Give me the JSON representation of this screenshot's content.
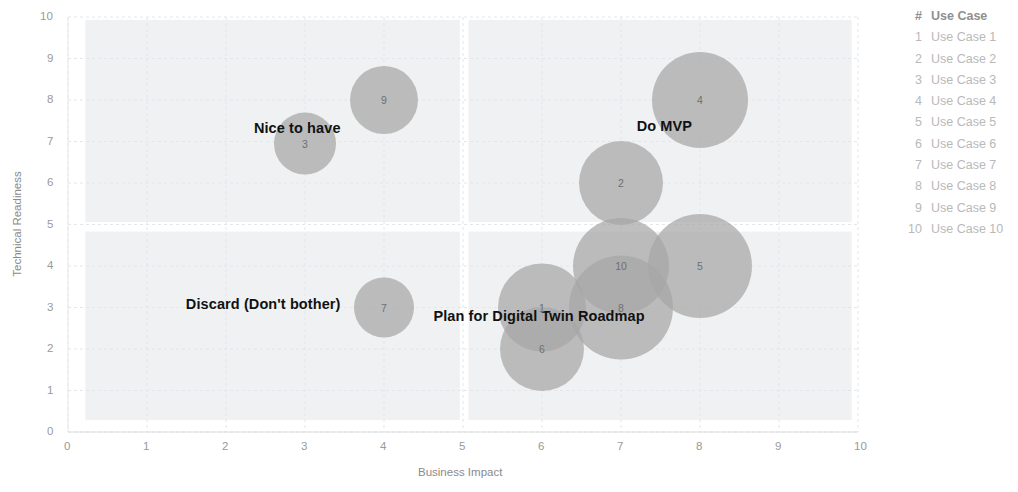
{
  "chart_data": {
    "type": "scatter",
    "title": "",
    "xlabel": "Business Impact",
    "ylabel": "Technical Readiness",
    "xlim": [
      0,
      10
    ],
    "ylim": [
      0,
      10
    ],
    "xticks": [
      "0",
      "1",
      "2",
      "3",
      "4",
      "5",
      "6",
      "7",
      "8",
      "9",
      "10"
    ],
    "yticks": [
      "0",
      "1",
      "2",
      "3",
      "4",
      "5",
      "6",
      "7",
      "8",
      "9",
      "10"
    ],
    "grid": true,
    "legend_position": "right",
    "bubble_color": "#a6a6a6",
    "bubble_opacity": 0.72,
    "quadrant_shade_color": "#eceef0",
    "points": [
      {
        "id": "1",
        "label": "Use Case 1",
        "x": 6.0,
        "y": 3.0,
        "size": 44
      },
      {
        "id": "2",
        "label": "Use Case 2",
        "x": 7.0,
        "y": 6.0,
        "size": 42
      },
      {
        "id": "3",
        "label": "Use Case 3",
        "x": 3.0,
        "y": 6.95,
        "size": 31
      },
      {
        "id": "4",
        "label": "Use Case 4",
        "x": 8.0,
        "y": 8.0,
        "size": 48
      },
      {
        "id": "5",
        "label": "Use Case 5",
        "x": 8.0,
        "y": 4.0,
        "size": 52
      },
      {
        "id": "6",
        "label": "Use Case 6",
        "x": 6.0,
        "y": 2.0,
        "size": 42
      },
      {
        "id": "7",
        "label": "Use Case 7",
        "x": 4.0,
        "y": 3.0,
        "size": 30
      },
      {
        "id": "8",
        "label": "Use Case 8",
        "x": 7.0,
        "y": 3.0,
        "size": 52
      },
      {
        "id": "9",
        "label": "Use Case 9",
        "x": 4.0,
        "y": 8.0,
        "size": 34
      },
      {
        "id": "10",
        "label": "Use Case 10",
        "x": 7.0,
        "y": 4.0,
        "size": 48
      }
    ],
    "quadrant_labels": [
      {
        "name": "nice-to-have",
        "text": "Nice to have",
        "x": 3.45,
        "y": 7.3
      },
      {
        "name": "do-mvp",
        "text": "Do MVP",
        "x": 7.9,
        "y": 7.35
      },
      {
        "name": "discard",
        "text": "Discard (Don't bother)",
        "x": 3.45,
        "y": 3.05
      },
      {
        "name": "plan-roadmap",
        "text": "Plan for Digital Twin Roadmap",
        "x": 7.3,
        "y": 2.78
      }
    ],
    "quadrant_regions": [
      {
        "name": "nice-to-have-region",
        "x0": 0.22,
        "x1": 4.96,
        "y0": 5.06,
        "y1": 9.93
      },
      {
        "name": "discard-region",
        "x0": 0.22,
        "x1": 4.96,
        "y0": 0.29,
        "y1": 4.83
      },
      {
        "name": "do-mvp-region",
        "x0": 5.07,
        "x1": 9.92,
        "y0": 5.06,
        "y1": 9.93
      },
      {
        "name": "plan-roadmap-region",
        "x0": 5.07,
        "x1": 9.92,
        "y0": 0.29,
        "y1": 4.83
      }
    ]
  },
  "legend": {
    "header": {
      "num": "#",
      "label": "Use Case"
    },
    "rows": [
      {
        "num": "1",
        "label": "Use Case 1"
      },
      {
        "num": "2",
        "label": "Use Case 2"
      },
      {
        "num": "3",
        "label": "Use Case 3"
      },
      {
        "num": "4",
        "label": "Use Case 4"
      },
      {
        "num": "5",
        "label": "Use Case 5"
      },
      {
        "num": "6",
        "label": "Use Case 6"
      },
      {
        "num": "7",
        "label": "Use Case 7"
      },
      {
        "num": "8",
        "label": "Use Case 8"
      },
      {
        "num": "9",
        "label": "Use Case 9"
      },
      {
        "num": "10",
        "label": "Use Case 10"
      }
    ]
  }
}
